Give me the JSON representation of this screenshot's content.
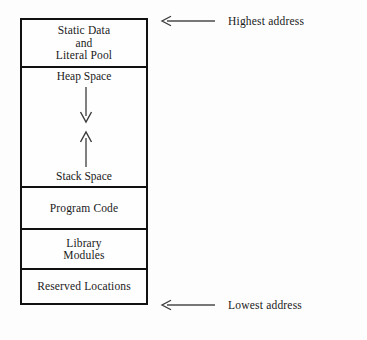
{
  "figure": {
    "type": "memory-layout-diagram",
    "background_color": "#fdfdfd",
    "line_color": "#111111",
    "text_color": "#1a1a1a"
  },
  "memory_map": {
    "segments": [
      {
        "id": "static-data",
        "label": "Static Data\nand\nLiteral Pool",
        "order_from_top": 1
      },
      {
        "id": "heap-stack",
        "label": "Heap Space",
        "secondary_label": "Stack Space",
        "order_from_top": 2,
        "heap_growth_direction": "down",
        "stack_growth_direction": "up"
      },
      {
        "id": "program-code",
        "label": "Program Code",
        "order_from_top": 3
      },
      {
        "id": "library-modules",
        "label": "Library\nModules",
        "order_from_top": 4
      },
      {
        "id": "reserved-locations",
        "label": "Reserved Locations",
        "order_from_top": 5
      }
    ]
  },
  "annotations": {
    "highest": {
      "label": "Highest address",
      "arrow_direction": "left",
      "points_to": "top of memory column"
    },
    "lowest": {
      "label": "Lowest address",
      "arrow_direction": "left",
      "points_to": "bottom of memory column"
    }
  }
}
